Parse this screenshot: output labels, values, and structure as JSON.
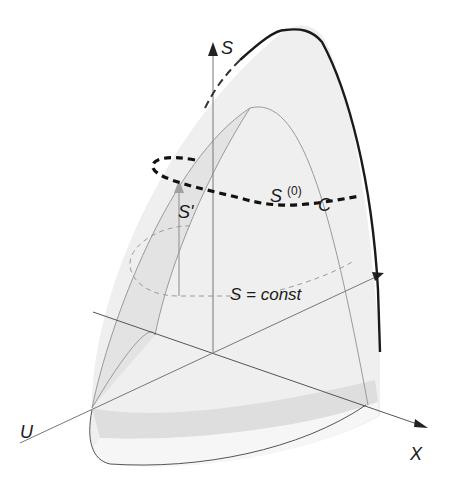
{
  "figure": {
    "type": "3d-surface-diagram",
    "colors": {
      "surface_fill": "#ececec",
      "surface_light": "#f4f4f4",
      "band_fill": "#dcdcdc",
      "axis_line": "#8a8a8a",
      "outline_dark": "#1a1a1a",
      "grid_line": "#9a9a9a",
      "dashed_curve": "#111111",
      "arrow_light": "#9c9c9c"
    },
    "axes": {
      "s": "S",
      "u": "U",
      "x": "X"
    },
    "labels": {
      "s0_base": "S",
      "s0_sup": "(0)",
      "curve": "C",
      "s_prime": "S'",
      "s_const": "S = const"
    }
  }
}
